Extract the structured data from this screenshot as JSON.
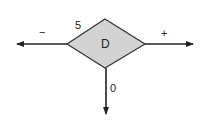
{
  "diagram": {
    "type": "decision-node",
    "node": {
      "label": "D",
      "shape": "diamond",
      "fill": "#d3d3d3",
      "stroke": "#333333"
    },
    "corner_label": "5",
    "branches": [
      {
        "direction": "left",
        "label": "−"
      },
      {
        "direction": "right",
        "label": "+"
      },
      {
        "direction": "down",
        "label": "0"
      }
    ]
  }
}
